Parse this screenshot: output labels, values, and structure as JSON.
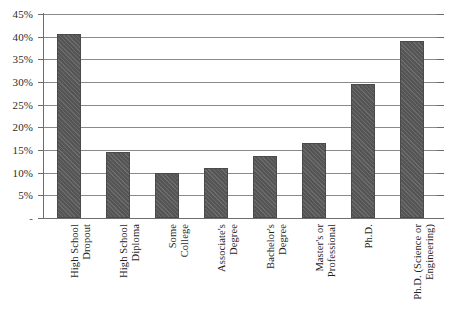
{
  "chart_data": {
    "type": "bar",
    "title": "",
    "subtitle": "",
    "xlabel": "",
    "ylabel": "",
    "categories": [
      "High School Dropout",
      "High School Diploma",
      "Some College",
      "Associate's Degree",
      "Bachelor's Degree",
      "Master's or Professional",
      "Ph.D.",
      "Ph.D. (Science or Engineering)"
    ],
    "category_lines": [
      [
        "High School",
        "Dropout"
      ],
      [
        "High School",
        "Diploma"
      ],
      [
        "Some",
        "College"
      ],
      [
        "Associate's",
        "Degree"
      ],
      [
        "Bachelor's",
        "Degree"
      ],
      [
        "Master's or",
        "Professional"
      ],
      [
        "Ph.D."
      ],
      [
        "Ph.D. (Science or",
        "Engineering)"
      ]
    ],
    "values": [
      40.5,
      14.5,
      10.0,
      11.0,
      13.7,
      16.5,
      29.5,
      39.0
    ],
    "ylim": [
      0,
      45
    ],
    "ytick_values": [
      0,
      5,
      10,
      15,
      20,
      25,
      30,
      35,
      40,
      45
    ],
    "ytick_labels": [
      "-",
      "5%",
      "10%",
      "15%",
      "20%",
      "25%",
      "30%",
      "35%",
      "40%",
      "45%"
    ],
    "grid": true,
    "legend": false,
    "legend_position": "none",
    "bar_color": "#5a5a5a",
    "gridline_color": "#8a8a8a",
    "axis_color": "#6b6b6b",
    "background_color": "#ffffff",
    "label_rotation": -90
  }
}
